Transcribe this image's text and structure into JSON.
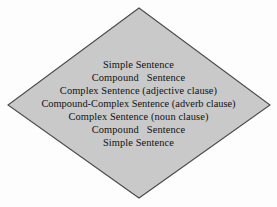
{
  "diagram": {
    "name": "sentence-variety-diamond",
    "shape": "diamond",
    "fill_color": "#c9c9c9",
    "stroke_color": "#4a4a4a",
    "background_color": "#fdfdfd",
    "text_color": "#111111",
    "vertices": {
      "top": [
        139,
        8
      ],
      "right": [
        270,
        105
      ],
      "bottom": [
        139,
        198
      ],
      "left": [
        8,
        105
      ]
    },
    "lines": [
      {
        "text": "Simple Sentence"
      },
      {
        "text": "Compound   Sentence"
      },
      {
        "text": "Complex Sentence (adjective clause)"
      },
      {
        "text": "Compound-Complex Sentence (adverb clause)"
      },
      {
        "text": "Complex Sentence (noun clause)"
      },
      {
        "text": "Compound   Sentence"
      },
      {
        "text": "Simple Sentence"
      }
    ]
  }
}
